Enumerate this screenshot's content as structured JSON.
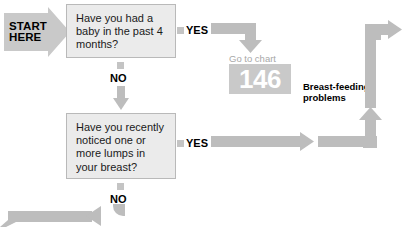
{
  "chart": {
    "start_label": "START\nHERE",
    "start_line1": "START",
    "start_line2": "HERE"
  },
  "questions": [
    {
      "id": "q1",
      "text": "Have you had a baby in the past 4 months?",
      "yes_label": "YES",
      "no_label": "NO"
    },
    {
      "id": "q2",
      "text": "Have you recently noticed one or more lumps in your breast?",
      "yes_label": "YES",
      "no_label": "NO"
    }
  ],
  "outcomes": {
    "goto_chart_label": "Go to chart",
    "goto_chart_number": "146",
    "diagnosis_label": "Breast-feeding problems"
  },
  "colors": {
    "arrow_gray": "#bdbdbd",
    "start_gray": "#c9c9c9",
    "box_fill": "#ebebeb",
    "box_border": "#b9b9b9",
    "badge_gray": "#c9c9c9",
    "badge_number": "#ffffff",
    "muted_text": "#a8a8a8",
    "text": "#1a1a1a"
  }
}
